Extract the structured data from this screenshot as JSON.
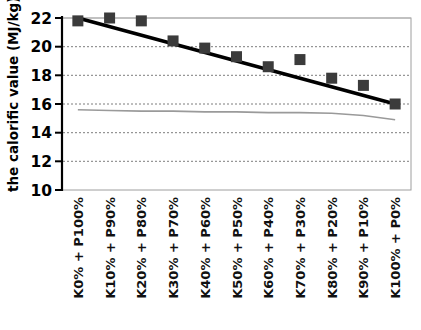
{
  "chart_data": {
    "type": "scatter",
    "title": "",
    "xlabel": "",
    "ylabel": "the calorific value (MJ/kg)",
    "ylim": [
      10,
      22
    ],
    "yticks": [
      10,
      12,
      14,
      16,
      18,
      20,
      22
    ],
    "ytick_labels": [
      "10",
      "12",
      "14",
      "16",
      "18",
      "20",
      "22"
    ],
    "grid": "horizontal dotted gridlines at 12, 14, 16, 18, 20; solid light line at 22",
    "legend": "none",
    "categories": [
      "K0% + P100%",
      "K10% + P90%",
      "K20% + P80%",
      "K30% + P70%",
      "K40% + P60%",
      "K50% + P50%",
      "K60% + P40%",
      "K70% + P30%",
      "K80% + P20%",
      "K90% + P10%",
      "K100% + P0%"
    ],
    "series": [
      {
        "name": "calorific value (markers)",
        "marker": "square",
        "color": "#3b3b3b",
        "values": [
          21.8,
          22.0,
          21.8,
          20.4,
          19.9,
          19.3,
          18.6,
          19.1,
          17.8,
          17.3,
          16.0
        ]
      },
      {
        "name": "trendline",
        "marker": "none",
        "style": "solid thick black line",
        "color": "#000000",
        "values": [
          22.0,
          21.4,
          20.8,
          20.2,
          19.6,
          19.0,
          18.4,
          17.8,
          17.2,
          16.6,
          16.0
        ]
      },
      {
        "name": "lower gray line",
        "marker": "none",
        "style": "thin gray line",
        "color": "#9a9a9a",
        "values": [
          15.6,
          15.55,
          15.5,
          15.5,
          15.45,
          15.45,
          15.4,
          15.4,
          15.35,
          15.2,
          14.9
        ]
      }
    ]
  },
  "colors": {
    "marker": "#3b3b3b",
    "trendline": "#000000",
    "gray_line": "#9a9a9a",
    "gridline": "#8c8c8c",
    "frame": "#9e9e9e",
    "axis": "#000000",
    "background": "#ffffff"
  }
}
